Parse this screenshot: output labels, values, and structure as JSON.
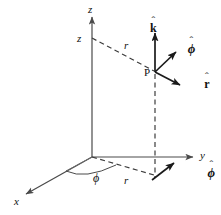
{
  "figure": {
    "background_color": "#ffffff",
    "line_color": "#4a4a4a",
    "vector_color": "#1a1a1a",
    "width": 221,
    "height": 215
  },
  "axes": [
    {
      "name": "z-axis",
      "label": "z",
      "style": "italic",
      "direction": "up"
    },
    {
      "name": "y-axis",
      "label": "y",
      "style": "italic",
      "direction": "right"
    },
    {
      "name": "x-axis",
      "label": "x",
      "style": "italic",
      "direction": "down-left"
    }
  ],
  "labels": {
    "z_axis": "z",
    "z_height": "z",
    "y_axis": "y",
    "x_axis": "x",
    "r_upper": "r",
    "r_lower": "r",
    "phi_angle": "ϕ",
    "point_p": "P"
  },
  "unit_vectors": [
    {
      "name": "k-hat",
      "base": "k",
      "hat": "ˆ",
      "description": "vertical unit vector at point P",
      "style": "bold-upright"
    },
    {
      "name": "phi-hat-upper",
      "base": "ϕ",
      "hat": "ˆ",
      "description": "azimuthal unit vector at point P",
      "style": "bold-italic"
    },
    {
      "name": "r-hat",
      "base": "r",
      "hat": "ˆ",
      "description": "radial unit vector at point P",
      "style": "bold-upright"
    },
    {
      "name": "phi-hat-lower",
      "base": "ϕ",
      "hat": "ˆ",
      "description": "azimuthal unit vector at projection of P on xy-plane",
      "style": "bold-italic"
    }
  ],
  "geometry": {
    "origin": {
      "x": 92,
      "y": 157
    },
    "point_p": {
      "x": 155,
      "y": 72
    },
    "projection_point": {
      "x": 155,
      "y": 175
    },
    "z_top": {
      "x": 92,
      "y": 14
    },
    "z_level": {
      "x": 92,
      "y": 38
    },
    "y_end": {
      "x": 196,
      "y": 157
    },
    "x_end": {
      "x": 22,
      "y": 197
    },
    "phi_arc_radius": 26
  }
}
